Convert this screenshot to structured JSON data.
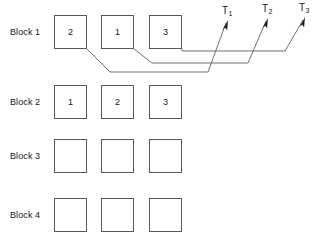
{
  "diagram": {
    "colors": {
      "box_border": "#555a5e",
      "wire": "#6b7075",
      "text": "#161616",
      "arrow": "#202020",
      "background": "#ffffff"
    },
    "rows": [
      {
        "label": "Block 1",
        "label_x": 10,
        "label_y": 28,
        "box_y": 15,
        "cells": [
          {
            "value": "2"
          },
          {
            "value": "1"
          },
          {
            "value": "3"
          }
        ]
      },
      {
        "label": "Block 2",
        "label_x": 10,
        "label_y": 98,
        "box_y": 85,
        "cells": [
          {
            "value": "1"
          },
          {
            "value": "2"
          },
          {
            "value": "3"
          }
        ]
      },
      {
        "label": "Block 3",
        "label_x": 10,
        "label_y": 152,
        "box_y": 139,
        "cells": [
          {
            "value": ""
          },
          {
            "value": ""
          },
          {
            "value": ""
          }
        ]
      },
      {
        "label": "Block 4",
        "label_x": 10,
        "label_y": 211,
        "box_y": 198,
        "cells": [
          {
            "value": ""
          },
          {
            "value": ""
          },
          {
            "value": ""
          }
        ]
      }
    ],
    "geometry": {
      "column_x": [
        54,
        101,
        149
      ],
      "box_width": 33,
      "box_height": 34
    },
    "terminals": [
      {
        "name": "T1",
        "label_main": "T",
        "label_sub": "1",
        "label_x": 222,
        "label_y": 6,
        "tip_x": 228,
        "tip_y": 20
      },
      {
        "name": "T2",
        "label_main": "T",
        "label_sub": "2",
        "label_x": 262,
        "label_y": 4,
        "tip_x": 268,
        "tip_y": 18
      },
      {
        "name": "T3",
        "label_main": "T",
        "label_sub": "3",
        "label_x": 299,
        "label_y": 3,
        "tip_x": 305,
        "tip_y": 17
      }
    ],
    "connectors": [
      {
        "name": "connector-block1-cell3-to-T3",
        "from_cell": "block-1-cell-3",
        "to_terminal": "T3",
        "points": "182,49 182,51 285,51 303,20"
      },
      {
        "name": "connector-block1-cell2-to-T2",
        "from_cell": "block-1-cell-2",
        "to_terminal": "T2",
        "points": "134,49 152,63 248,63 266,21"
      },
      {
        "name": "connector-block1-cell1-to-T1",
        "from_cell": "block-1-cell-1",
        "to_terminal": "T1",
        "points": "87,49 110,72 208,72 226,23"
      }
    ]
  }
}
